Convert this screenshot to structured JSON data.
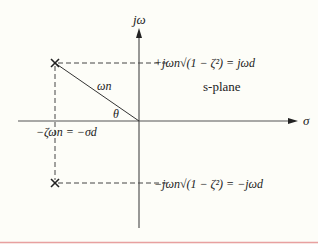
{
  "diagram": {
    "axes": {
      "vertical_label": "jω",
      "horizontal_label": "σ"
    },
    "plane_label": "s-plane",
    "vector_label": "ωn",
    "angle_label": "θ",
    "upper_pole_label": "+jωn√(1 − ζ²) = jωd",
    "lower_pole_label": "−jωn√(1 − ζ²) = −jωd",
    "real_part_label": "−ζωn = −σd",
    "pole_marker": "×",
    "colors": {
      "background": "#fdfdf8",
      "lines": "#333333",
      "bottom_rule": "#e8a0a0"
    }
  }
}
